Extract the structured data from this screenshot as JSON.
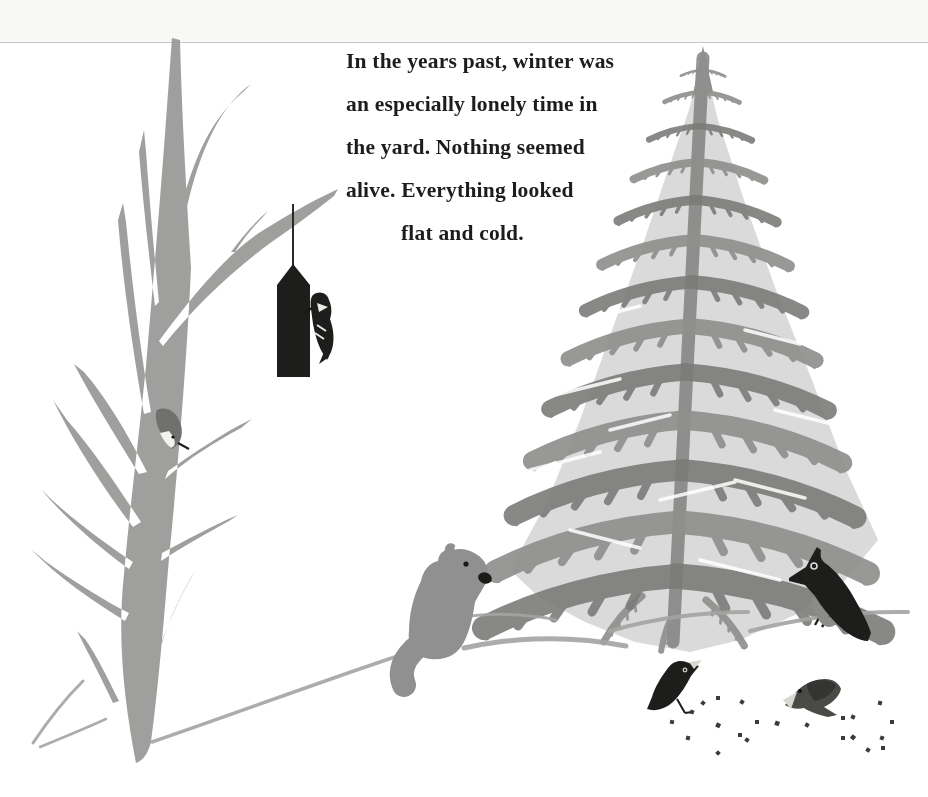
{
  "page": {
    "width": 928,
    "height": 797,
    "background": "#ffffff",
    "top_edge_band": "#f8f8f6",
    "top_edge_line": "#c6c6c4"
  },
  "story_text": {
    "color": "#1d1d1b",
    "lines": [
      "In the years past, winter was",
      "an especially lonely time in",
      "the yard. Nothing seemed",
      "alive. Everything looked",
      "flat and cold."
    ]
  },
  "palette": {
    "bare_tree": "#9c9c9a",
    "evergreen_light": "#8f8f8d",
    "evergreen_dark": "#7b7b79",
    "evergreen_wash": "#a8a8a6",
    "ink_black": "#1d1d1b",
    "squirrel_gray": "#909090",
    "bird_gray": "#4a4a46",
    "wing_gray": "#343432",
    "belly_gray": "#8c8c8a",
    "snow_line": "#a4a4a2",
    "seed": "#3b3b37",
    "beak_pale": "#d8d8d0",
    "belly_white": "#f2f2f0"
  },
  "scene": {
    "bare_tree": "bare winter tree",
    "evergreen": "evergreen tree",
    "bird_feeder": "hanging bird feeder",
    "woodpecker": "woodpecker on feeder",
    "nuthatch": "nuthatch on trunk",
    "squirrel": "gray squirrel on snow bank",
    "jay": "crested jay on snow line",
    "ground_bird_left": "black bird eating seeds",
    "ground_bird_right": "gray bird pecking seeds",
    "seeds": "scattered seeds",
    "snow_lines": "snow ground lines"
  }
}
